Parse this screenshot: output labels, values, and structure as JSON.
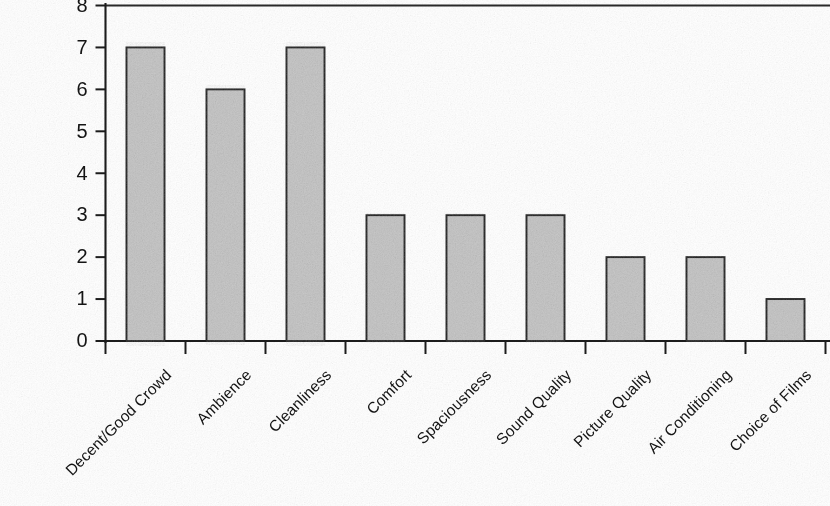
{
  "chart_data": {
    "type": "bar",
    "title": "",
    "subtitle": "",
    "xlabel": "",
    "ylabel": "",
    "ylim": [
      0,
      8
    ],
    "ytick_labels": [
      "0",
      "1",
      "2",
      "3",
      "4",
      "5",
      "6",
      "7",
      "8"
    ],
    "ytick_values": [
      0,
      1,
      2,
      3,
      4,
      5,
      6,
      7,
      8
    ],
    "grid": false,
    "legend": false,
    "legend_position": "none",
    "orientation": "vertical",
    "categories": [
      "Decent/Good Crowd",
      "Ambience",
      "Cleanliness",
      "Comfort",
      "Spaciousness",
      "Sound Quality",
      "Picture Quality",
      "Air Conditioning",
      "Choice of Films"
    ],
    "values": [
      7,
      6,
      7,
      3,
      3,
      3,
      2,
      2,
      1
    ],
    "series": [
      {
        "name": "Count",
        "values": [
          7,
          6,
          7,
          3,
          3,
          3,
          2,
          2,
          1
        ]
      }
    ],
    "bar_fill_color": "#c6c6c6",
    "bar_edge_color": "#1f1f1f",
    "axis_color": "#1c1c1c",
    "background_color": "#ffffff",
    "label_rotation_degrees": -45
  },
  "axis": {
    "y_label_font_px": 20,
    "category_label_font_px": 15.5
  }
}
